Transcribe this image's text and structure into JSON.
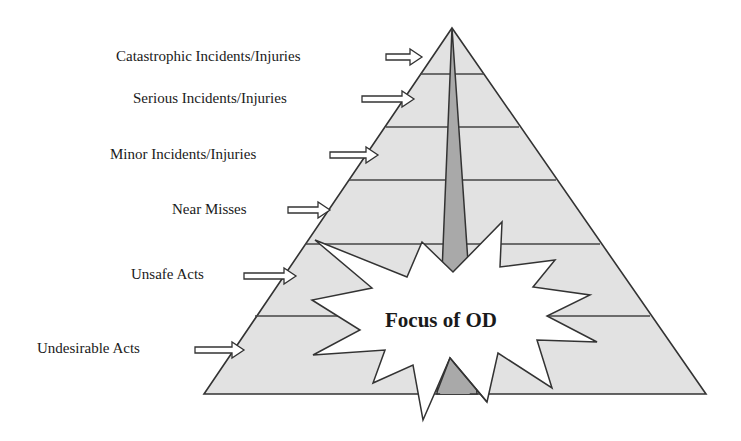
{
  "diagram": {
    "levels": [
      {
        "label": "Catastrophic Incidents/Injuries",
        "x": 116,
        "y": 47,
        "arrow": [
          386,
          57
        ]
      },
      {
        "label": "Serious Incidents/Injuries",
        "x": 133,
        "y": 89,
        "arrow": [
          362,
          99
        ]
      },
      {
        "label": "Minor Incidents/Injuries",
        "x": 110,
        "y": 145,
        "arrow": [
          330,
          155
        ]
      },
      {
        "label": "Near Misses",
        "x": 172,
        "y": 200,
        "arrow": [
          288,
          210
        ]
      },
      {
        "label": "Unsafe Acts",
        "x": 131,
        "y": 265,
        "arrow": [
          244,
          276
        ]
      },
      {
        "label": "Undesirable Acts",
        "x": 37,
        "y": 339,
        "arrow": [
          195,
          350
        ]
      }
    ],
    "focus_label": "Focus of OD",
    "colors": {
      "pyramid_fill": "#e2e2e2",
      "spire_fill": "#a9a9a9",
      "outline": "#333333",
      "starburst_fill": "#ffffff",
      "text": "#1a1a1a"
    }
  }
}
